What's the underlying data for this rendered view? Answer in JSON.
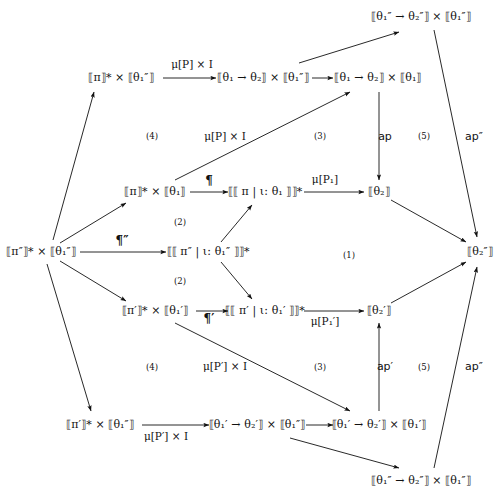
{
  "diagram": {
    "type": "commutative-diagram",
    "width": 503,
    "height": 499,
    "background_color": "#ffffff",
    "ink_color": "#111111",
    "nodes": [
      {
        "id": "n_top_right",
        "label": "⟦θ₁″ → θ₂″⟧ × ⟦θ₁″⟧",
        "x": 421,
        "y": 17
      },
      {
        "id": "n_r1_a",
        "label": "⟦π⟧* × ⟦θ₁″⟧",
        "x": 121,
        "y": 78
      },
      {
        "id": "n_r1_b",
        "label": "⟦θ₁ → θ₂⟧ × ⟦θ₁″⟧",
        "x": 263,
        "y": 78
      },
      {
        "id": "n_r1_c",
        "label": "⟦θ₁ → θ₂⟧ × ⟦θ₁⟧",
        "x": 378,
        "y": 78
      },
      {
        "id": "n_r2_a",
        "label": "⟦π⟧* × ⟦θ₁⟧",
        "x": 155,
        "y": 192
      },
      {
        "id": "n_r2_b",
        "label": "⟦⟦ π | ι: θ₁ ⟧⟧*",
        "x": 265,
        "y": 192
      },
      {
        "id": "n_r2_c",
        "label": "⟦θ₂⟧",
        "x": 379,
        "y": 192
      },
      {
        "id": "n_left",
        "label": "⟦π″⟧* × ⟦θ₁″⟧",
        "x": 41,
        "y": 252
      },
      {
        "id": "n_mid",
        "label": "⟦⟦ π″ | ι: θ₁″ ⟧⟧*",
        "x": 208,
        "y": 252
      },
      {
        "id": "n_right",
        "label": "⟦θ₂″⟧",
        "x": 480,
        "y": 252
      },
      {
        "id": "n_r4_a",
        "label": "⟦π′⟧* × ⟦θ₁′⟧",
        "x": 155,
        "y": 311
      },
      {
        "id": "n_r4_b",
        "label": "⟦⟦ π′ | ι: θ₁′ ⟧⟧*",
        "x": 265,
        "y": 311
      },
      {
        "id": "n_r4_c",
        "label": "⟦θ₂′⟧",
        "x": 379,
        "y": 311
      },
      {
        "id": "n_r5_a",
        "label": "⟦π′⟧* × ⟦θ₁″⟧",
        "x": 100,
        "y": 425
      },
      {
        "id": "n_r5_b",
        "label": "⟦θ₁′ → θ₂′⟧ × ⟦θ₁″⟧",
        "x": 257,
        "y": 425
      },
      {
        "id": "n_r5_c",
        "label": "⟦θ₁′ → θ₂′⟧ × ⟦θ₁′⟧",
        "x": 379,
        "y": 425
      },
      {
        "id": "n_bot_right",
        "label": "⟦θ₁″ → θ₂″⟧ × ⟦θ₁″⟧",
        "x": 421,
        "y": 481
      }
    ],
    "edge_labels": [
      {
        "id": "lbl_muP_I_top",
        "text": "μ[P] × I",
        "x": 192,
        "y": 65,
        "style": "serif"
      },
      {
        "id": "lbl_muP_I_mid",
        "text": "μ[P] × I",
        "x": 225,
        "y": 137,
        "style": "serif"
      },
      {
        "id": "lbl_pilcrow",
        "text": "¶",
        "x": 209,
        "y": 182,
        "style": "pilcrow"
      },
      {
        "id": "lbl_muP1",
        "text": "μ[P₁]",
        "x": 325,
        "y": 180,
        "style": "serif"
      },
      {
        "id": "lbl_pilcrow_dbl",
        "text": "¶″",
        "x": 122,
        "y": 242,
        "style": "pilcrow"
      },
      {
        "id": "lbl_ap",
        "text": "ap",
        "x": 385,
        "y": 137,
        "style": "sans"
      },
      {
        "id": "lbl_ap_dbl_top",
        "text": "ap″",
        "x": 474,
        "y": 137,
        "style": "sans"
      },
      {
        "id": "lbl_pilcrow_pr",
        "text": "¶′",
        "x": 209,
        "y": 320,
        "style": "pilcrow"
      },
      {
        "id": "lbl_muP1_pr",
        "text": "μ[P₁′]",
        "x": 325,
        "y": 322,
        "style": "serif"
      },
      {
        "id": "lbl_muPpr_I_mid",
        "text": "μ[P′] × I",
        "x": 225,
        "y": 367,
        "style": "serif"
      },
      {
        "id": "lbl_ap_pr",
        "text": "ap′",
        "x": 385,
        "y": 367,
        "style": "sans"
      },
      {
        "id": "lbl_ap_dbl_bot",
        "text": "ap″",
        "x": 474,
        "y": 367,
        "style": "sans"
      },
      {
        "id": "lbl_muPpr_I_bot",
        "text": "μ[P′] × I",
        "x": 166,
        "y": 437,
        "style": "serif"
      }
    ],
    "region_labels": [
      {
        "id": "region_4_top",
        "text": "(4)",
        "x": 152,
        "y": 136
      },
      {
        "id": "region_3_top",
        "text": "(3)",
        "x": 320,
        "y": 136
      },
      {
        "id": "region_5_top",
        "text": "(5)",
        "x": 424,
        "y": 136
      },
      {
        "id": "region_2_top",
        "text": "(2)",
        "x": 180,
        "y": 222
      },
      {
        "id": "region_2_bot",
        "text": "(2)",
        "x": 180,
        "y": 281
      },
      {
        "id": "region_1",
        "text": "(1)",
        "x": 349,
        "y": 255
      },
      {
        "id": "region_4_bot",
        "text": "(4)",
        "x": 152,
        "y": 367
      },
      {
        "id": "region_3_bot",
        "text": "(3)",
        "x": 320,
        "y": 367
      },
      {
        "id": "region_5_bot",
        "text": "(5)",
        "x": 424,
        "y": 367
      }
    ],
    "arrows": [
      {
        "id": "a_r1a_r1b",
        "from": "n_r1_a",
        "to": "n_r1_b",
        "x1": 163,
        "y1": 78,
        "x2": 216,
        "y2": 78
      },
      {
        "id": "a_r1b_r1c",
        "from": "n_r1_b",
        "to": "n_r1_c",
        "x1": 312,
        "y1": 78,
        "x2": 333,
        "y2": 78
      },
      {
        "id": "a_r1c_topr",
        "from": "n_r1_c",
        "to": "n_top_right",
        "x1": 299,
        "y1": 63,
        "x2": 399,
        "y2": 32
      },
      {
        "id": "a_topr_right",
        "from": "n_top_right",
        "to": "n_right",
        "x1": 434,
        "y1": 30,
        "x2": 477,
        "y2": 237
      },
      {
        "id": "a_r2a_r2b",
        "from": "n_r2_a",
        "to": "n_r2_b",
        "x1": 190,
        "y1": 192,
        "x2": 228,
        "y2": 192
      },
      {
        "id": "a_r2b_r2c",
        "from": "n_r2_b",
        "to": "n_r2_c",
        "x1": 304,
        "y1": 192,
        "x2": 364,
        "y2": 192
      },
      {
        "id": "a_r2a_r1c",
        "from": "n_r2_a",
        "to": "n_r1_c",
        "x1": 175,
        "y1": 180,
        "x2": 350,
        "y2": 92
      },
      {
        "id": "a_r1c_r2c",
        "from": "n_r1_c",
        "to": "n_r2_c",
        "x1": 379,
        "y1": 92,
        "x2": 379,
        "y2": 180
      },
      {
        "id": "a_r2c_right",
        "from": "n_r2_c",
        "to": "n_right",
        "x1": 391,
        "y1": 200,
        "x2": 466,
        "y2": 242
      },
      {
        "id": "a_left_r1a",
        "from": "n_left",
        "to": "n_r1_a",
        "x1": 53,
        "y1": 240,
        "x2": 94,
        "y2": 92
      },
      {
        "id": "a_left_r2a",
        "from": "n_left",
        "to": "n_r2_a",
        "x1": 60,
        "y1": 243,
        "x2": 126,
        "y2": 203
      },
      {
        "id": "a_left_mid",
        "from": "n_left",
        "to": "n_mid",
        "x1": 80,
        "y1": 252,
        "x2": 166,
        "y2": 252
      },
      {
        "id": "a_left_r4a",
        "from": "n_left",
        "to": "n_r4_a",
        "x1": 60,
        "y1": 261,
        "x2": 126,
        "y2": 301
      },
      {
        "id": "a_left_r5a",
        "from": "n_left",
        "to": "n_r5_a",
        "x1": 47,
        "y1": 264,
        "x2": 91,
        "y2": 411
      },
      {
        "id": "a_mid_r2b",
        "from": "n_mid",
        "to": "n_r2_b",
        "x1": 221,
        "y1": 242,
        "x2": 252,
        "y2": 205
      },
      {
        "id": "a_mid_r4b",
        "from": "n_mid",
        "to": "n_r4_b",
        "x1": 221,
        "y1": 262,
        "x2": 252,
        "y2": 299
      },
      {
        "id": "a_r4a_r4b",
        "from": "n_r4_a",
        "to": "n_r4_b",
        "x1": 196,
        "y1": 311,
        "x2": 228,
        "y2": 311
      },
      {
        "id": "a_r4b_r4c",
        "from": "n_r4_b",
        "to": "n_r4_c",
        "x1": 304,
        "y1": 311,
        "x2": 364,
        "y2": 311
      },
      {
        "id": "a_r4a_r5c",
        "from": "n_r4_a",
        "to": "n_r5_c",
        "x1": 175,
        "y1": 323,
        "x2": 350,
        "y2": 411
      },
      {
        "id": "a_r5c_r4c",
        "from": "n_r5_c",
        "to": "n_r4_c",
        "x1": 379,
        "y1": 411,
        "x2": 379,
        "y2": 323
      },
      {
        "id": "a_r4c_right",
        "from": "n_r4_c",
        "to": "n_right",
        "x1": 391,
        "y1": 303,
        "x2": 466,
        "y2": 262
      },
      {
        "id": "a_r5a_r5b",
        "from": "n_r5_a",
        "to": "n_r5_b",
        "x1": 142,
        "y1": 425,
        "x2": 209,
        "y2": 425
      },
      {
        "id": "a_r5b_r5c",
        "from": "n_r5_b",
        "to": "n_r5_c",
        "x1": 306,
        "y1": 425,
        "x2": 333,
        "y2": 425
      },
      {
        "id": "a_r5b_botr",
        "from": "n_r5_b",
        "to": "n_bot_right",
        "x1": 290,
        "y1": 438,
        "x2": 399,
        "y2": 468
      },
      {
        "id": "a_botr_right",
        "from": "n_bot_right",
        "to": "n_right",
        "x1": 434,
        "y1": 468,
        "x2": 477,
        "y2": 267
      }
    ]
  }
}
